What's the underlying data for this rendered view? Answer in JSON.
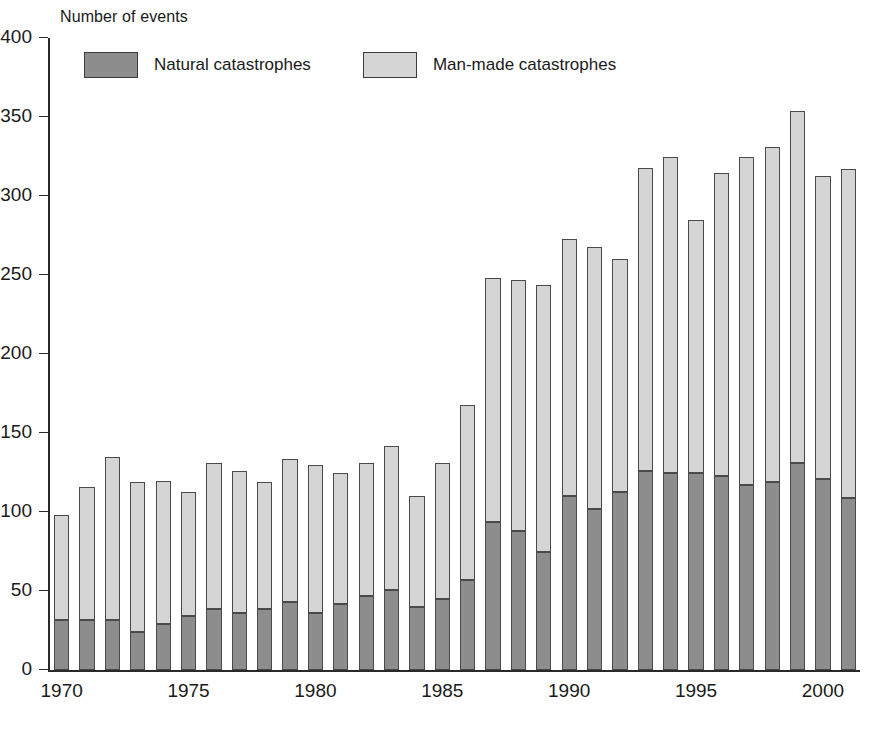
{
  "chart_data": {
    "type": "bar",
    "subtype": "stacked-vertical",
    "title": "Number of events",
    "xlabel": "",
    "ylabel": "Number of events",
    "ylim": [
      0,
      400
    ],
    "ytick_step": 50,
    "yticks": [
      0,
      50,
      100,
      150,
      200,
      250,
      300,
      350,
      400
    ],
    "xticks": [
      1970,
      1975,
      1980,
      1985,
      1990,
      1995,
      2000
    ],
    "grid": false,
    "legend_position": "top-left-inside",
    "categories": [
      1970,
      1971,
      1972,
      1973,
      1974,
      1975,
      1976,
      1977,
      1978,
      1979,
      1980,
      1981,
      1982,
      1983,
      1984,
      1985,
      1986,
      1987,
      1988,
      1989,
      1990,
      1991,
      1992,
      1993,
      1994,
      1995,
      1996,
      1997,
      1998,
      1999,
      2000,
      2001
    ],
    "series": [
      {
        "name": "Natural catastrophes",
        "color": "#8d8d8d",
        "values": [
          32,
          32,
          32,
          24,
          29,
          34,
          39,
          36,
          39,
          43,
          36,
          42,
          47,
          51,
          40,
          45,
          57,
          94,
          88,
          75,
          110,
          102,
          113,
          126,
          125,
          125,
          123,
          117,
          119,
          131,
          121,
          109
        ]
      },
      {
        "name": "Man-made catastrophes",
        "color": "#d5d5d5",
        "values": [
          66,
          84,
          103,
          95,
          91,
          79,
          92,
          90,
          80,
          91,
          94,
          83,
          84,
          91,
          70,
          86,
          111,
          154,
          159,
          169,
          163,
          166,
          147,
          192,
          200,
          160,
          192,
          208,
          212,
          223,
          192,
          208
        ]
      }
    ],
    "totals": [
      98,
      116,
      135,
      119,
      120,
      113,
      131,
      126,
      119,
      134,
      130,
      125,
      131,
      142,
      110,
      131,
      168,
      248,
      247,
      244,
      273,
      268,
      260,
      318,
      325,
      285,
      315,
      325,
      331,
      354,
      313,
      317
    ]
  },
  "legend": {
    "items": [
      {
        "label": "Natural catastrophes",
        "color": "#8d8d8d"
      },
      {
        "label": "Man-made catastrophes",
        "color": "#d5d5d5"
      }
    ]
  },
  "colors": {
    "natural": "#8d8d8d",
    "manmade": "#d5d5d5",
    "axis": "#2a2a2a",
    "bar_border": "#4a4a4a",
    "background": "#ffffff"
  }
}
